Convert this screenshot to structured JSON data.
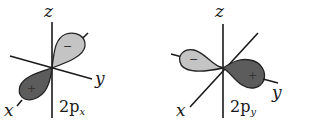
{
  "diagrams": [
    {
      "name": "2px-orbital",
      "axes": {
        "z": "z",
        "y": "y",
        "x": "x"
      },
      "label": {
        "main": "2p",
        "subscript": "x"
      },
      "lobes": {
        "negative_sign": "−",
        "positive_sign": "+"
      }
    },
    {
      "name": "2py-orbital",
      "axes": {
        "z": "z",
        "y": "y",
        "x": "x"
      },
      "label": {
        "main": "2p",
        "subscript": "y"
      },
      "lobes": {
        "negative_sign": "−",
        "positive_sign": "+"
      }
    }
  ],
  "colors": {
    "negative_lobe": "#c4c4c4",
    "positive_lobe": "#5c5c5c",
    "axis": "#1a1a1a"
  }
}
